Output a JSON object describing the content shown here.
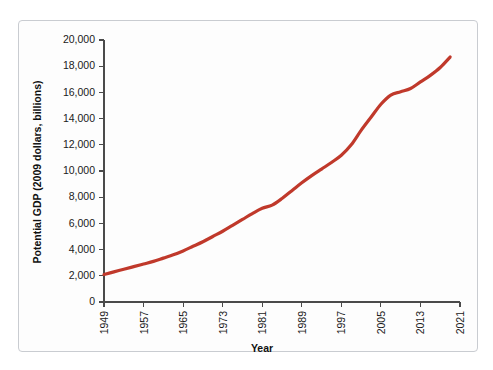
{
  "figure": {
    "background_color": "#fdfdfd",
    "border_color": "#c9ccd1"
  },
  "chart_data": {
    "type": "line",
    "title": "",
    "xlabel": "Year",
    "ylabel": "Potential GDP (2009 dollars, billions)",
    "xlim": [
      1949,
      2021
    ],
    "ylim": [
      0,
      20000
    ],
    "grid": false,
    "legend": "none",
    "line_color": "#c0392b",
    "line_width": 3.2,
    "xticks": [
      1949,
      1957,
      1965,
      1973,
      1981,
      1989,
      1997,
      2005,
      2013,
      2021
    ],
    "xtick_labels": [
      "1949",
      "1957",
      "1965",
      "1973",
      "1981",
      "1989",
      "1997",
      "2005",
      "2013",
      "2021"
    ],
    "yticks": [
      0,
      2000,
      4000,
      6000,
      8000,
      10000,
      12000,
      14000,
      16000,
      18000,
      20000
    ],
    "ytick_labels": [
      "0",
      "2,000",
      "4,000",
      "6,000",
      "8,000",
      "10,000",
      "12,000",
      "14,000",
      "16,000",
      "18,000",
      "20,000"
    ],
    "x": [
      1949,
      1951,
      1953,
      1955,
      1957,
      1959,
      1961,
      1963,
      1965,
      1967,
      1969,
      1971,
      1973,
      1975,
      1977,
      1979,
      1981,
      1983,
      1985,
      1987,
      1989,
      1991,
      1993,
      1995,
      1997,
      1999,
      2001,
      2003,
      2005,
      2007,
      2009,
      2011,
      2013,
      2015,
      2017,
      2019
    ],
    "values": [
      2100,
      2300,
      2500,
      2700,
      2900,
      3100,
      3350,
      3600,
      3900,
      4250,
      4600,
      5000,
      5400,
      5850,
      6300,
      6750,
      7150,
      7400,
      7900,
      8500,
      9100,
      9650,
      10150,
      10650,
      11200,
      12000,
      13100,
      14100,
      15100,
      15800,
      16050,
      16300,
      16800,
      17300,
      17900,
      18700
    ]
  },
  "axes": {
    "y_axis_name": "y-axis",
    "x_axis_name": "x-axis"
  }
}
